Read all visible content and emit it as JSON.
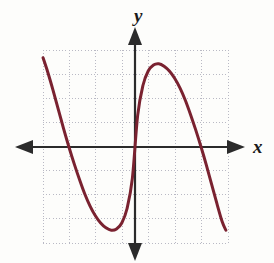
{
  "figure": {
    "title": "",
    "background_color": "#fdfdfb",
    "width": 274,
    "height": 263
  },
  "axes": {
    "x_label": "x",
    "y_label": "y",
    "axis_color": "#2b2b2b",
    "x_axis_pixel_y": 147,
    "y_axis_pixel_x": 135,
    "arrowheads": [
      "left",
      "right",
      "up",
      "down"
    ]
  },
  "grid": {
    "visible": true,
    "style": "dotted",
    "color": "#b9b9c4",
    "left": 43,
    "right": 228,
    "top": 50,
    "bottom": 243,
    "columns": 7,
    "rows": 8,
    "cell_width": 26.43,
    "cell_height": 24.13
  },
  "icons": {
    "arrow_up": "arrow-up-icon",
    "arrow_down": "arrow-down-icon",
    "arrow_left": "arrow-left-icon",
    "arrow_right": "arrow-right-icon"
  },
  "chart_data": {
    "type": "line",
    "title": "",
    "xlabel": "x",
    "ylabel": "y",
    "grid": true,
    "legend": null,
    "series": [
      {
        "name": "polynomial-curve",
        "color": "#7a2230",
        "line_width": 3,
        "xlim": [
          -3.5,
          3.5
        ],
        "ylim": [
          -4.0,
          4.0
        ],
        "x": [
          -3.48,
          -3.3,
          -3.1,
          -2.9,
          -2.7,
          -2.5,
          -2.3,
          -2.1,
          -1.9,
          -1.7,
          -1.5,
          -1.3,
          -1.1,
          -0.9,
          -0.7,
          -0.5,
          -0.3,
          -0.1,
          0.1,
          0.3,
          0.5,
          0.7,
          0.9,
          1.1,
          1.3,
          1.5,
          1.7,
          1.9,
          2.1,
          2.3,
          2.5,
          2.7,
          2.9,
          3.1,
          3.3,
          3.44
        ],
        "y": [
          3.7,
          3.1,
          2.35,
          1.55,
          0.75,
          0.0,
          -0.7,
          -1.35,
          -1.95,
          -2.45,
          -2.85,
          -3.15,
          -3.35,
          -3.45,
          -3.4,
          -3.15,
          -2.55,
          -1.3,
          1.3,
          2.55,
          3.15,
          3.4,
          3.45,
          3.35,
          3.15,
          2.85,
          2.45,
          1.95,
          1.35,
          0.7,
          0.0,
          -0.75,
          -1.55,
          -2.35,
          -3.1,
          -3.45
        ],
        "key_points": {
          "x_intercepts": [
            -2.5,
            0.0,
            2.5
          ],
          "local_minimum": [
            -0.9,
            -3.45
          ],
          "local_maximum": [
            0.9,
            3.45
          ],
          "left_endpoint": [
            -3.48,
            3.7
          ],
          "right_endpoint": [
            3.44,
            -3.45
          ]
        }
      }
    ],
    "xticks": [
      -3,
      -2,
      -1,
      0,
      1,
      2,
      3
    ],
    "yticks": [
      -4,
      -3,
      -2,
      -1,
      0,
      1,
      2,
      3,
      4
    ],
    "xtick_labels": [],
    "ytick_labels": []
  }
}
